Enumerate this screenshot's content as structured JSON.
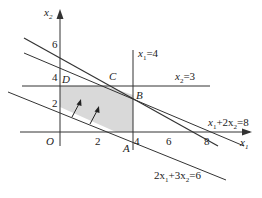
{
  "diagram": {
    "type": "linear-programming-feasible-region",
    "axes": {
      "x_label": "x",
      "x_sub": "1",
      "y_label": "x",
      "y_sub": "2",
      "origin_label": "O",
      "x_ticks": [
        "2",
        "4",
        "6",
        "8"
      ],
      "y_ticks": [
        "2",
        "4",
        "6"
      ]
    },
    "points": {
      "A": "A",
      "B": "B",
      "C": "C",
      "D": "D"
    },
    "lines": [
      {
        "id": "x1-eq-4",
        "label_main": "x",
        "label_sub": "1",
        "label_rest": "=4"
      },
      {
        "id": "x2-eq-3",
        "label_main": "x",
        "label_sub": "2",
        "label_rest": "=3"
      },
      {
        "id": "x1-plus-2x2-eq-8",
        "label_parts": [
          "x",
          "1",
          "+2x",
          "2",
          "=8"
        ]
      },
      {
        "id": "2x1-plus-3x2-eq-6",
        "label_parts": [
          "2x",
          "1",
          "+3x",
          "2",
          "=6"
        ]
      }
    ],
    "region_fill": "#d9d9d9",
    "line_color": "#333333"
  }
}
